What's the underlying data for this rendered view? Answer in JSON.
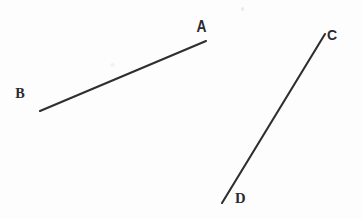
{
  "figure": {
    "kind": "hand-drawn-geometry-diagram",
    "width": 362,
    "height": 219,
    "background_color": "#fdfdfd",
    "ink_color": "#2e2e33",
    "label_color": "#2b2b30"
  },
  "labels": {
    "a": "A",
    "b": "B",
    "c": "C",
    "d": "D"
  },
  "chart_data": {
    "type": "scatter",
    "title": "",
    "xlabel": "",
    "ylabel": "",
    "xlim": [
      0,
      362
    ],
    "ylim": [
      219,
      0
    ],
    "grid": false,
    "legend": "none",
    "points": [
      {
        "name": "A",
        "x": 206,
        "y": 41,
        "label": "A",
        "label_x": 196,
        "label_y": 19
      },
      {
        "name": "B",
        "x": 40,
        "y": 111,
        "label": "B",
        "label_x": 15,
        "label_y": 86
      },
      {
        "name": "C",
        "x": 325,
        "y": 34,
        "label": "C",
        "label_x": 327,
        "label_y": 28
      },
      {
        "name": "D",
        "x": 222,
        "y": 203,
        "label": "D",
        "label_x": 235,
        "label_y": 191
      }
    ],
    "segments": [
      {
        "name": "segment-AB",
        "from": "B",
        "to": "A",
        "x1": 40,
        "y1": 111,
        "x2": 206,
        "y2": 41
      },
      {
        "name": "segment-CD",
        "from": "D",
        "to": "C",
        "x1": 222,
        "y1": 203,
        "x2": 325,
        "y2": 34
      }
    ],
    "artifacts": [
      {
        "name": "speck",
        "x": 242,
        "y": 8,
        "size": 3
      },
      {
        "name": "smudge",
        "x": 112,
        "y": 65,
        "size": 4
      }
    ]
  }
}
